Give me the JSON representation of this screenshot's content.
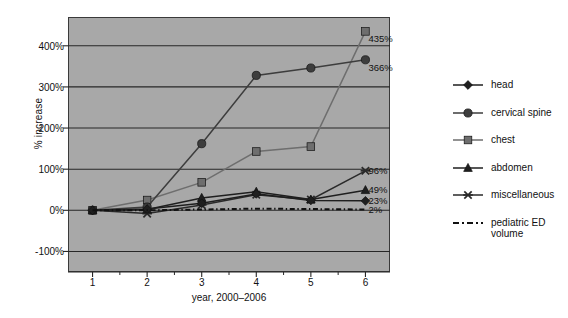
{
  "chart_data": {
    "type": "line",
    "title": "",
    "xlabel": "year, 2000–2006",
    "ylabel": "% increase",
    "x": [
      1,
      2,
      3,
      4,
      5,
      6
    ],
    "xticklabels": [
      "1",
      "2",
      "3",
      "4",
      "5",
      "6"
    ],
    "yticklabels": [
      "-100%",
      "0%",
      "100%",
      "200%",
      "300%",
      "400%"
    ],
    "ytickvalues": [
      -100,
      0,
      100,
      200,
      300,
      400
    ],
    "ylim": [
      -150,
      470
    ],
    "xlim": [
      0.55,
      6.45
    ],
    "grid": "horizontal",
    "legend_position": "right",
    "plot_background": "#a8a8a8",
    "figure_background": "#ffffff",
    "series": [
      {
        "name": "head",
        "marker": "diamond",
        "color": "#1f1f1f",
        "linestyle": "solid",
        "values": [
          0,
          3,
          17,
          40,
          24,
          23
        ],
        "end_label": "23%"
      },
      {
        "name": "cervical spine",
        "marker": "circle",
        "color": "#3d3d3d",
        "linestyle": "solid",
        "values": [
          0,
          8,
          162,
          328,
          346,
          366
        ],
        "end_label": "366%"
      },
      {
        "name": "chest",
        "marker": "square",
        "color": "#6e6e6e",
        "linestyle": "solid",
        "values": [
          0,
          25,
          68,
          143,
          155,
          435
        ],
        "end_label": "435%"
      },
      {
        "name": "abdomen",
        "marker": "triangle",
        "color": "#1f1f1f",
        "linestyle": "solid",
        "values": [
          0,
          2,
          30,
          45,
          26,
          49
        ],
        "end_label": "49%"
      },
      {
        "name": "miscellaneous",
        "marker": "x",
        "color": "#2a2a2a",
        "linestyle": "solid",
        "values": [
          0,
          -8,
          13,
          38,
          26,
          96
        ],
        "end_label": "96%"
      },
      {
        "name": "pediatric ED volume",
        "marker": "none",
        "color": "#111111",
        "linestyle": "dashdot",
        "values": [
          0,
          0,
          2,
          4,
          3,
          2
        ],
        "end_label": "2%"
      }
    ],
    "data_labels": [
      {
        "text": "435%",
        "series": "chest"
      },
      {
        "text": "366%",
        "series": "cervical spine"
      },
      {
        "text": "96%",
        "series": "miscellaneous"
      },
      {
        "text": "49%",
        "series": "abdomen"
      },
      {
        "text": "23%",
        "series": "head"
      },
      {
        "text": "2%",
        "series": "pediatric ED volume"
      }
    ]
  },
  "legend": {
    "items": [
      {
        "label": "head"
      },
      {
        "label": "cervical spine"
      },
      {
        "label": "chest"
      },
      {
        "label": "abdomen"
      },
      {
        "label": "miscellaneous"
      },
      {
        "label": "pediatric ED volume"
      }
    ]
  }
}
